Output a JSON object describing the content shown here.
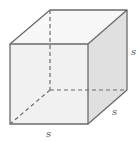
{
  "diagram": {
    "type": "cube",
    "labels": {
      "height": "s",
      "depth": "s",
      "width": "s"
    },
    "colors": {
      "edge": "#6b6b6b",
      "front_face": "#f2f2f2",
      "top_face": "#f7f7f7",
      "side_face": "#e2e2e2",
      "label": "#555555"
    }
  }
}
